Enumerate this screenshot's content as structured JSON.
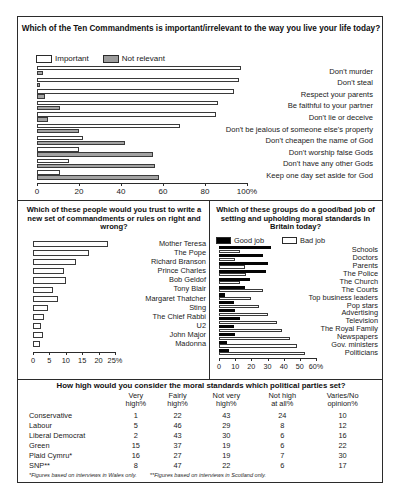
{
  "chart_data": [
    {
      "id": "ten-commandments",
      "type": "bar",
      "orientation": "horizontal",
      "title": "Which of the Ten Commandments is important/irrelevant to the way you live your life today?",
      "xlabel": "",
      "ylabel": "",
      "xlim": [
        0,
        100
      ],
      "xticks": [
        0,
        20,
        40,
        60,
        80,
        100
      ],
      "xticklabels": [
        "0",
        "20",
        "40",
        "60",
        "80",
        "100%"
      ],
      "grid": false,
      "legend_position": "top-left",
      "legend": [
        "Important",
        "Not relevant"
      ],
      "series": [
        {
          "name": "Important",
          "color": "#ffffff",
          "values": [
            97,
            96,
            94,
            86,
            85,
            68,
            22,
            20,
            15,
            11
          ]
        },
        {
          "name": "Not relevant",
          "color": "#a3a3a3",
          "values": [
            3,
            1,
            4,
            11,
            5,
            20,
            42,
            55,
            56,
            58
          ]
        }
      ],
      "categories": [
        "Don't murder",
        "Don't steal",
        "Respect  your parents",
        "Be faithful to your partner",
        "Don't lie or deceive",
        "Don't be jealous of someone else's property",
        "Don't cheapen the name of God",
        "Don't worship false Gods",
        "Don't have any other Gods",
        "Keep one day set aside for God"
      ]
    },
    {
      "id": "trust-to-write",
      "type": "bar",
      "orientation": "horizontal",
      "title": "Which of these people would you trust to write a new set of commandments or rules on right and wrong?",
      "xlabel": "",
      "ylabel": "",
      "xlim": [
        0,
        25
      ],
      "xticks": [
        0,
        5,
        10,
        15,
        20,
        25
      ],
      "xticklabels": [
        "0",
        "5",
        "10",
        "15",
        "20",
        "25%"
      ],
      "grid": false,
      "legend_position": "none",
      "series": [
        {
          "name": "Would trust",
          "color": "#ffffff",
          "values": [
            23,
            17,
            13,
            9.5,
            10,
            6,
            7.5,
            4.5,
            3.5,
            2.5,
            3,
            2
          ]
        }
      ],
      "categories": [
        "Mother Teresa",
        "The Pope",
        "Richard Branson",
        "Prince Charles",
        "Bob Geldof",
        "Tony Blair",
        "Margaret Thatcher",
        "Sting",
        "The Chief Rabbi",
        "U2",
        "John Major",
        "Madonna"
      ]
    },
    {
      "id": "good-bad-job",
      "type": "bar",
      "orientation": "horizontal",
      "title": "Which of these groups do a good/bad job of setting and upholding moral standards in Britain today?",
      "xlabel": "",
      "ylabel": "",
      "xlim": [
        0,
        60
      ],
      "xticks": [
        0,
        10,
        20,
        30,
        40,
        50,
        60
      ],
      "xticklabels": [
        "0",
        "10",
        "20",
        "30",
        "40",
        "50",
        "60%"
      ],
      "grid": false,
      "legend_position": "top-left",
      "legend": [
        "Good job",
        "Bad job"
      ],
      "series": [
        {
          "name": "Good job",
          "color": "#050505",
          "values": [
            32,
            27,
            30,
            29,
            19,
            16,
            4,
            9,
            10,
            13,
            9,
            10,
            5,
            6
          ]
        },
        {
          "name": "Bad job",
          "color": "#ffffff",
          "values": [
            13,
            10,
            16,
            17,
            13,
            27,
            20,
            25,
            30,
            36,
            39,
            44,
            48,
            53
          ]
        }
      ],
      "categories": [
        "Schools",
        "Doctors",
        "Parents",
        "The Police",
        "The Church",
        "The Courts",
        "Top business leaders",
        "Pop stars",
        "Advertising",
        "Television",
        "The Royal Family",
        "Newspapers",
        "Gov. ministers",
        "Politicians"
      ]
    },
    {
      "id": "political-parties-moral-standards",
      "type": "table",
      "title": "How high would you consider the moral standards which political parties set?",
      "columns": [
        "",
        "Very high%",
        "Fairly high%",
        "Not very high%",
        "Not high at all%",
        "Varies/No opinion%"
      ],
      "column_headers_lines": [
        [
          "",
          ""
        ],
        [
          "Very",
          "high%"
        ],
        [
          "Fairly",
          "high%"
        ],
        [
          "Not very",
          "high%"
        ],
        [
          "Not high",
          "at all%"
        ],
        [
          "Varies/No",
          "opinion%"
        ]
      ],
      "rows": [
        {
          "label": "Conservative",
          "values": [
            1,
            22,
            43,
            24,
            10
          ]
        },
        {
          "label": "Labour",
          "values": [
            5,
            46,
            29,
            8,
            12
          ]
        },
        {
          "label": "Liberal Democrat",
          "values": [
            2,
            43,
            30,
            6,
            16
          ]
        },
        {
          "label": "Green",
          "values": [
            15,
            37,
            19,
            6,
            22
          ]
        },
        {
          "label": "Plaid Cymru*",
          "values": [
            16,
            27,
            19,
            7,
            30
          ]
        },
        {
          "label": "SNP**",
          "values": [
            8,
            47,
            22,
            6,
            17
          ]
        }
      ],
      "footnotes": [
        "*Figures based on interviews in Wales only.",
        "**Figures based on interviews in Scotland only."
      ]
    }
  ],
  "colors": {
    "border": "#2b2b2b",
    "important_fill": "#ffffff",
    "not_relevant_fill": "#a3a3a3",
    "good_job_fill": "#050505",
    "bad_job_fill": "#ffffff",
    "text": "#1a1a1a"
  }
}
